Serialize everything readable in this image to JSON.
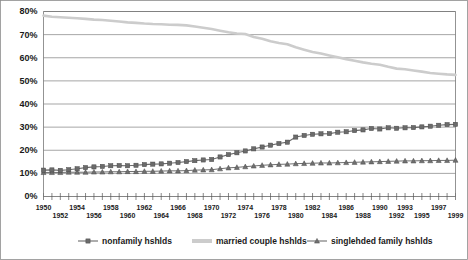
{
  "chart_data": {
    "type": "line",
    "title": "",
    "xlabel": "",
    "ylabel": "",
    "ylim": [
      0,
      80
    ],
    "ytick_values": [
      0,
      10,
      20,
      30,
      40,
      50,
      60,
      70,
      80
    ],
    "ytick_labels": [
      "0%",
      "10%",
      "20%",
      "30%",
      "40%",
      "50%",
      "60%",
      "70%",
      "80%"
    ],
    "grid": true,
    "legend_position": "bottom",
    "x": [
      1950,
      1951,
      1952,
      1953,
      1954,
      1955,
      1956,
      1957,
      1958,
      1959,
      1960,
      1961,
      1962,
      1963,
      1964,
      1965,
      1966,
      1967,
      1968,
      1969,
      1970,
      1971,
      1972,
      1973,
      1974,
      1975,
      1976,
      1977,
      1978,
      1979,
      1980,
      1981,
      1982,
      1983,
      1984,
      1985,
      1986,
      1987,
      1988,
      1989,
      1990,
      1991,
      1992,
      1993,
      1994,
      1995,
      1996,
      1997,
      1998,
      1999
    ],
    "xtick_labels_top": [
      "1950",
      "1954",
      "1958",
      "1962",
      "1966",
      "1970",
      "1974",
      "1978",
      "1982",
      "1986",
      "1990",
      "1993",
      "1997"
    ],
    "xtick_labels_top_x": [
      1950,
      1954,
      1958,
      1962,
      1966,
      1970,
      1974,
      1978,
      1982,
      1986,
      1990,
      1993,
      1997
    ],
    "xtick_labels_bottom": [
      "1952",
      "1956",
      "1960",
      "1964",
      "1968",
      "1972",
      "1976",
      "1980",
      "1984",
      "1988",
      "1992",
      "1995",
      "1999"
    ],
    "xtick_labels_bottom_x": [
      1952,
      1956,
      1960,
      1964,
      1968,
      1972,
      1976,
      1980,
      1984,
      1988,
      1992,
      1995,
      1999
    ],
    "series": [
      {
        "name": "nonfamily hshlds",
        "color": "#6b6b6b",
        "marker": "square",
        "line_width": 1.1,
        "values": [
          11.4,
          11.5,
          11.3,
          11.6,
          12.0,
          12.5,
          12.8,
          13.0,
          13.3,
          13.4,
          13.3,
          13.5,
          13.8,
          14.0,
          14.1,
          14.4,
          14.7,
          15.1,
          15.5,
          15.8,
          16.0,
          17.1,
          18.1,
          18.9,
          19.7,
          20.6,
          21.4,
          22.2,
          22.9,
          23.5,
          25.7,
          26.4,
          26.9,
          27.1,
          27.2,
          27.8,
          28.0,
          28.5,
          28.8,
          29.4,
          29.2,
          29.7,
          29.5,
          29.7,
          29.8,
          30.1,
          30.4,
          30.8,
          31.1,
          31.2
        ]
      },
      {
        "name": "married couple hshlds",
        "color": "#cccccc",
        "marker": "none",
        "line_width": 2.6,
        "values": [
          78.2,
          77.7,
          77.5,
          77.3,
          77.1,
          76.8,
          76.5,
          76.3,
          76.0,
          75.7,
          75.3,
          75.1,
          74.8,
          74.6,
          74.5,
          74.3,
          74.2,
          74.0,
          73.5,
          73.0,
          72.4,
          71.7,
          71.0,
          70.5,
          70.3,
          69.0,
          68.2,
          67.1,
          66.4,
          65.8,
          64.5,
          63.5,
          62.5,
          61.8,
          61.0,
          60.2,
          59.4,
          58.7,
          58.0,
          57.4,
          57.0,
          56.1,
          55.3,
          55.0,
          54.5,
          54.0,
          53.4,
          53.1,
          52.8,
          52.6
        ]
      },
      {
        "name": "singlehded family hshlds",
        "color": "#707070",
        "marker": "triangle",
        "line_width": 1.0,
        "values": [
          10.4,
          10.4,
          10.4,
          10.5,
          10.5,
          10.5,
          10.6,
          10.6,
          10.7,
          10.7,
          10.8,
          10.8,
          10.9,
          10.9,
          11.0,
          11.1,
          11.1,
          11.2,
          11.4,
          11.5,
          11.6,
          12.0,
          12.4,
          12.6,
          12.9,
          13.2,
          13.5,
          13.7,
          13.9,
          14.0,
          14.2,
          14.3,
          14.4,
          14.5,
          14.5,
          14.6,
          14.7,
          14.8,
          14.9,
          15.0,
          15.1,
          15.2,
          15.3,
          15.4,
          15.4,
          15.5,
          15.5,
          15.6,
          15.6,
          15.7
        ]
      }
    ],
    "legend": [
      {
        "label": "nonfamily hshlds",
        "color": "#6b6b6b",
        "marker": "square"
      },
      {
        "label": "married couple hshlds",
        "color": "#cccccc",
        "marker": "band"
      },
      {
        "label": "singlehded family hshlds",
        "color": "#707070",
        "marker": "triangle"
      }
    ]
  }
}
